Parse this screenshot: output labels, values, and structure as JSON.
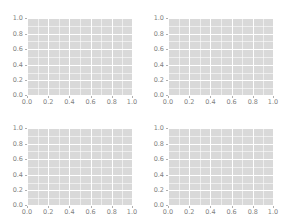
{
  "figure": {
    "title": "",
    "background_color": "#ffffff",
    "rows": 2,
    "cols": 2,
    "panel_background_color": "#d9d9d9",
    "gridline_color": "#ffffff",
    "tick_color": "#b0b0b0",
    "tick_label_color": "#7f7f7f"
  },
  "chart_data": [
    {
      "type": "scatter",
      "title": "",
      "subtitle": "",
      "xlabel": "",
      "ylabel": "",
      "xlim": [
        0.0,
        1.0
      ],
      "ylim": [
        0.0,
        1.0
      ],
      "xticks": [
        0.0,
        0.2,
        0.4,
        0.6,
        0.8,
        1.0
      ],
      "yticks": [
        0.0,
        0.2,
        0.4,
        0.6,
        0.8,
        1.0
      ],
      "xticklabels": [
        "0.0",
        "0.2",
        "0.4",
        "0.6",
        "0.8",
        "1.0"
      ],
      "yticklabels": [
        "0.0",
        "0.2",
        "0.4",
        "0.6",
        "0.8",
        "1.0"
      ],
      "grid": true,
      "minor_grid": true,
      "legend": null,
      "series": [],
      "x": [],
      "y": [],
      "annotations": []
    },
    {
      "type": "scatter",
      "title": "",
      "subtitle": "",
      "xlabel": "",
      "ylabel": "",
      "xlim": [
        0.0,
        1.0
      ],
      "ylim": [
        0.0,
        1.0
      ],
      "xticks": [
        0.0,
        0.2,
        0.4,
        0.6,
        0.8,
        1.0
      ],
      "yticks": [
        0.0,
        0.2,
        0.4,
        0.6,
        0.8,
        1.0
      ],
      "xticklabels": [
        "0.0",
        "0.2",
        "0.4",
        "0.6",
        "0.8",
        "1.0"
      ],
      "yticklabels": [
        "0.0",
        "0.2",
        "0.4",
        "0.6",
        "0.8",
        "1.0"
      ],
      "grid": true,
      "minor_grid": true,
      "legend": null,
      "series": [],
      "x": [],
      "y": [],
      "annotations": []
    },
    {
      "type": "scatter",
      "title": "",
      "subtitle": "",
      "xlabel": "",
      "ylabel": "",
      "xlim": [
        0.0,
        1.0
      ],
      "ylim": [
        0.0,
        1.0
      ],
      "xticks": [
        0.0,
        0.2,
        0.4,
        0.6,
        0.8,
        1.0
      ],
      "yticks": [
        0.0,
        0.2,
        0.4,
        0.6,
        0.8,
        1.0
      ],
      "xticklabels": [
        "0.0",
        "0.2",
        "0.4",
        "0.6",
        "0.8",
        "1.0"
      ],
      "yticklabels": [
        "0.0",
        "0.2",
        "0.4",
        "0.6",
        "0.8",
        "1.0"
      ],
      "grid": true,
      "minor_grid": true,
      "legend": null,
      "series": [],
      "x": [],
      "y": [],
      "annotations": []
    },
    {
      "type": "scatter",
      "title": "",
      "subtitle": "",
      "xlabel": "",
      "ylabel": "",
      "xlim": [
        0.0,
        1.0
      ],
      "ylim": [
        0.0,
        1.0
      ],
      "xticks": [
        0.0,
        0.2,
        0.4,
        0.6,
        0.8,
        1.0
      ],
      "yticks": [
        0.0,
        0.2,
        0.4,
        0.6,
        0.8,
        1.0
      ],
      "xticklabels": [
        "0.0",
        "0.2",
        "0.4",
        "0.6",
        "0.8",
        "1.0"
      ],
      "yticklabels": [
        "0.0",
        "0.2",
        "0.4",
        "0.6",
        "0.8",
        "1.0"
      ],
      "grid": true,
      "minor_grid": true,
      "legend": null,
      "series": [],
      "x": [],
      "y": [],
      "annotations": []
    }
  ]
}
